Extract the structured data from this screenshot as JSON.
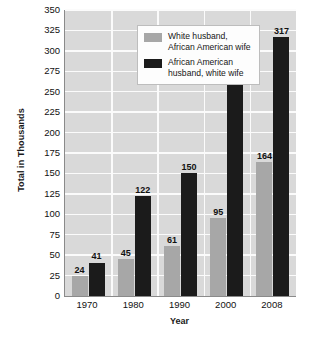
{
  "chart_data": {
    "type": "bar",
    "title": "",
    "xlabel": "Year",
    "ylabel": "Total in Thousands",
    "categories": [
      "1970",
      "1980",
      "1990",
      "2000",
      "2008"
    ],
    "series": [
      {
        "name": "White husband,\nAfrican American wife",
        "color": "#a7a7a7",
        "values": [
          24,
          45,
          61,
          95,
          164
        ]
      },
      {
        "name": "African American\nhusband, white wife",
        "color": "#1b1b1b",
        "values": [
          41,
          122,
          150,
          268,
          317
        ]
      }
    ],
    "ylim": [
      0,
      350
    ],
    "ytick_step": 25,
    "yticks": [
      0,
      25,
      50,
      75,
      100,
      125,
      150,
      175,
      200,
      225,
      250,
      275,
      300,
      325,
      350
    ],
    "ytick_labels": [
      "0",
      "25",
      "50",
      "75",
      "100",
      "125",
      "150",
      "175",
      "200",
      "225",
      "250",
      "275",
      "300",
      "325",
      "350"
    ],
    "grid": true,
    "grid_color": "#fbfbfb",
    "plot_background": "#d9d9d9",
    "legend_position": "top-left",
    "show_data_labels": true
  },
  "axes": {
    "y_title": "Total in Thousands",
    "x_title": "Year"
  },
  "legend": {
    "entries": [
      {
        "label": "White husband,\nAfrican American wife",
        "swatch": "series-0-swatch"
      },
      {
        "label": "African American\nhusband, white wife",
        "swatch": "series-1-swatch"
      }
    ]
  }
}
